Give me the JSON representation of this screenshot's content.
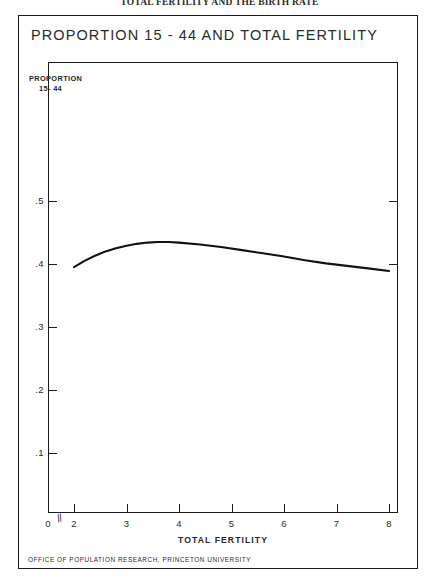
{
  "page": {
    "running_head": "TOTAL FERTILITY AND THE BIRTH RATE",
    "figure_title": "PROPORTION 15 - 44 AND TOTAL FERTILITY",
    "footer": "OFFICE OF POPULATION RESEARCH, PRINCETON UNIVERSITY",
    "axis_break_glyph": "//",
    "colors": {
      "ink": "#1c1c1c",
      "text": "#2a2a2a",
      "background": "#ffffff",
      "curve": "#111111"
    }
  },
  "chart_data": {
    "type": "line",
    "title": "PROPORTION 15 - 44 AND TOTAL FERTILITY",
    "xlabel": "TOTAL FERTILITY",
    "ylabel": "PROPORTION 15-44",
    "ylabel_line1": "PROPORTION",
    "ylabel_line2": "15- 44",
    "xlim": [
      2,
      8
    ],
    "ylim": [
      0,
      0.6
    ],
    "grid": false,
    "legend": null,
    "x_origin_label": "0",
    "axis_break": true,
    "xticks": [
      2,
      3,
      4,
      5,
      6,
      7,
      8
    ],
    "xtick_labels": [
      "2",
      "3",
      "4",
      "5",
      "6",
      "7",
      "8"
    ],
    "yticks": [
      0.1,
      0.2,
      0.3,
      0.4,
      0.5
    ],
    "ytick_labels": [
      ".1",
      ".2",
      ".3",
      ".4",
      ".5"
    ],
    "yticks_right": [
      0.4,
      0.5
    ],
    "series": [
      {
        "name": "Proportion 15-44",
        "x": [
          2.0,
          2.2,
          2.4,
          2.6,
          2.8,
          3.0,
          3.2,
          3.4,
          3.6,
          3.8,
          4.0,
          4.4,
          4.8,
          5.2,
          5.6,
          6.0,
          6.4,
          6.8,
          7.2,
          7.6,
          8.0
        ],
        "y": [
          0.395,
          0.405,
          0.413,
          0.42,
          0.425,
          0.429,
          0.432,
          0.434,
          0.435,
          0.435,
          0.434,
          0.431,
          0.427,
          0.422,
          0.417,
          0.412,
          0.406,
          0.401,
          0.397,
          0.393,
          0.389
        ]
      }
    ]
  }
}
